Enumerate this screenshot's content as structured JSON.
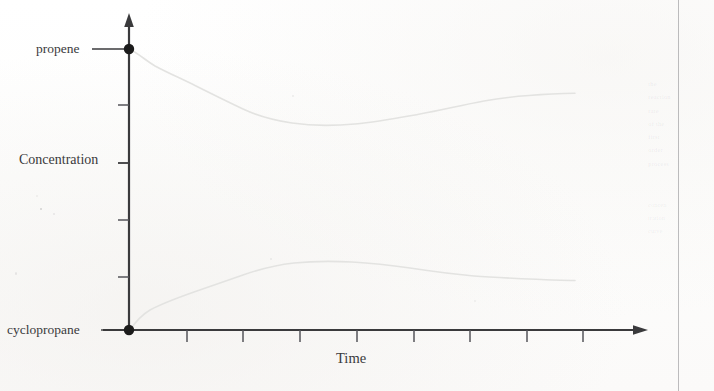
{
  "figure": {
    "caption_labels": {
      "y_axis_title": "Concentration",
      "x_axis_title": "Time",
      "top_series_label": "propene",
      "bottom_series_label": "cyclopropane"
    },
    "colors": {
      "axis": "#3a3a3c",
      "curve": "#e3e3e1",
      "marker": "#1b1b1b",
      "paper": "#fefefe",
      "ghost": "#78787d"
    },
    "ghost_marginalia": [
      "the",
      "reaction",
      "rate",
      "of the",
      "first",
      "order",
      "process"
    ],
    "ghost_marginalia_2": [
      "concen",
      "tration",
      "curve"
    ]
  },
  "chart_data": {
    "type": "line",
    "title": "",
    "xlabel": "Time",
    "ylabel": "Concentration",
    "grid": false,
    "legend": "inline-endpoint-labels",
    "xlim": [
      0,
      9
    ],
    "ylim": [
      0,
      5
    ],
    "x_tick_count": 9,
    "y_tick_count": 4,
    "x_tick_labels": [],
    "y_tick_labels": [],
    "annotations": [
      {
        "text": "propene",
        "at_x": 0,
        "at_y": 5.0,
        "marker": true
      },
      {
        "text": "cyclopropane",
        "at_x": 0,
        "at_y": 0.0,
        "marker": true
      }
    ],
    "series": [
      {
        "name": "propene",
        "color": "#e3e3e1",
        "x": [
          0.0,
          0.3,
          0.8,
          1.4,
          2.0,
          2.6,
          3.2,
          3.8,
          4.3,
          4.8,
          5.4,
          6.0,
          6.6,
          7.2,
          7.8,
          8.2
        ],
        "y": [
          5.0,
          4.86,
          4.69,
          4.47,
          4.22,
          3.96,
          3.72,
          3.54,
          3.43,
          3.39,
          3.42,
          3.49,
          3.55,
          3.62,
          3.71,
          3.74
        ]
      },
      {
        "name": "cyclopropane",
        "color": "#e3e3e1",
        "x": [
          0.0,
          0.3,
          0.8,
          1.4,
          2.0,
          2.6,
          3.2,
          3.8,
          4.3,
          4.8,
          5.4,
          6.0,
          6.6,
          7.2,
          7.8,
          8.2
        ],
        "y": [
          0.0,
          0.26,
          0.5,
          0.72,
          0.94,
          1.15,
          1.36,
          1.5,
          1.53,
          1.5,
          1.46,
          1.42,
          1.36,
          1.31,
          1.27,
          1.26
        ]
      }
    ]
  }
}
